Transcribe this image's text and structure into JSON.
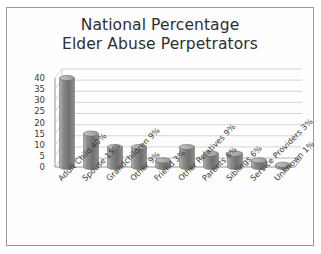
{
  "chart_data": {
    "type": "bar",
    "title": "National Percentage Elder Abuse Perpetrators",
    "title_lines": [
      "National Percentage",
      "Elder Abuse Perpetrators"
    ],
    "xlabel": "",
    "ylabel": "",
    "ylim": [
      0,
      40
    ],
    "yticks": [
      40,
      35,
      30,
      25,
      20,
      15,
      10,
      5,
      0
    ],
    "grid": true,
    "legend": "none",
    "style": "3d-cylinder",
    "categories": [
      "Adult Child 40%",
      "Spouse 15%",
      "Grandchildren 9%",
      "Other 9%",
      "Friend 3%",
      "Other Relatives 9%",
      "Parents 6%",
      "Siblings 6%",
      "Service Providers 3%",
      "Unknown 1%"
    ],
    "values": [
      40,
      15,
      9,
      9,
      3,
      9,
      6,
      6,
      3,
      1
    ],
    "series": [
      {
        "name": "National Percentage",
        "values": [
          40,
          15,
          9,
          9,
          3,
          9,
          6,
          6,
          3,
          1
        ]
      }
    ]
  },
  "colors": {
    "frame_border": "#9a9a9a",
    "background": "#ffffff",
    "bar_fill": "#8d8d8d",
    "bar_fill_light": "#b4b4b4",
    "bar_fill_dark": "#6f6f6f",
    "bar_outline": "#6a6a6a",
    "gridline": "#c9c9c9",
    "axis_line": "#8a8a8a",
    "title_text": "#2f2f2f",
    "tick_text": "#3a3a3a"
  }
}
